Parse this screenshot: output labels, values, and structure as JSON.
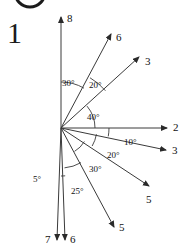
{
  "figure": {
    "number": "1",
    "origin": {
      "x": 61,
      "y": 128
    },
    "background_color": "#ffffff",
    "line_color": "#3a3a3a",
    "text_color": "#111111"
  },
  "top_partial_circle": {
    "name": "partial-circle-crop",
    "cx": 30,
    "cy": -8,
    "r": 15
  },
  "rays": [
    {
      "label": "8",
      "direction": "up",
      "angle_deg_from_up": 0,
      "tip": {
        "x": 61,
        "y": 17
      },
      "label_pos": {
        "x": 67,
        "y": 13
      }
    },
    {
      "label": "6",
      "direction": "up-right",
      "angle_deg_from_up": 30,
      "tip": {
        "x": 111,
        "y": 34
      },
      "label_pos": {
        "x": 116,
        "y": 32
      }
    },
    {
      "label": "3",
      "direction": "up-right",
      "angle_deg_from_up": 50,
      "tip": {
        "x": 139,
        "y": 57
      },
      "label_pos": {
        "x": 145,
        "y": 56
      }
    },
    {
      "label": "2",
      "direction": "right",
      "angle_deg_from_up": 90,
      "tip": {
        "x": 167,
        "y": 128
      },
      "label_pos": {
        "x": 173,
        "y": 122
      }
    },
    {
      "label": "3",
      "direction": "down-right",
      "angle_deg_from_up": 100,
      "tip": {
        "x": 166,
        "y": 150
      },
      "label_pos": {
        "x": 172,
        "y": 145
      }
    },
    {
      "label": "5",
      "direction": "down-right",
      "angle_deg_from_up": 120,
      "tip": {
        "x": 149,
        "y": 186
      },
      "label_pos": {
        "x": 146,
        "y": 194
      }
    },
    {
      "label": "5",
      "direction": "down-right-steep",
      "angle_deg_from_up": 150,
      "tip": {
        "x": 114,
        "y": 227
      },
      "label_pos": {
        "x": 119,
        "y": 222
      }
    },
    {
      "label": "6",
      "direction": "down",
      "angle_deg_from_up": 175,
      "tip": {
        "x": 65,
        "y": 240
      },
      "label_pos": {
        "x": 70,
        "y": 234
      }
    },
    {
      "label": "7",
      "direction": "down",
      "angle_deg_from_up": 180,
      "tip": {
        "x": 57,
        "y": 240
      },
      "label_pos": {
        "x": 45,
        "y": 234
      }
    }
  ],
  "angle_labels": [
    {
      "text": "30°",
      "x": 62,
      "y": 78
    },
    {
      "text": "20°",
      "x": 89,
      "y": 80
    },
    {
      "text": "40°",
      "x": 87,
      "y": 112
    },
    {
      "text": "10°",
      "x": 124,
      "y": 137
    },
    {
      "text": "20°",
      "x": 107,
      "y": 150
    },
    {
      "text": "30°",
      "x": 89,
      "y": 164
    },
    {
      "text": "25°",
      "x": 71,
      "y": 186
    },
    {
      "text": "5°",
      "x": 33,
      "y": 174
    }
  ],
  "angle_arcs": [
    {
      "name": "arc-30-up-to-6",
      "radius": 46,
      "start_deg_from_up": 0,
      "end_deg_from_up": 30
    },
    {
      "name": "arc-20-6-to-3",
      "radius": 58,
      "start_deg_from_up": 30,
      "end_deg_from_up": 50
    },
    {
      "name": "arc-40-3-to-2",
      "radius": 34,
      "start_deg_from_up": 50,
      "end_deg_from_up": 90
    },
    {
      "name": "arc-10-2-to-3",
      "radius": 48,
      "start_deg_from_up": 90,
      "end_deg_from_up": 100
    },
    {
      "name": "arc-20-3-to-5",
      "radius": 36,
      "start_deg_from_up": 100,
      "end_deg_from_up": 120
    },
    {
      "name": "arc-30-5-to-5",
      "radius": 27,
      "start_deg_from_up": 120,
      "end_deg_from_up": 150
    },
    {
      "name": "arc-25-5-to-6",
      "radius": 40,
      "start_deg_from_up": 150,
      "end_deg_from_up": 175
    },
    {
      "name": "arc-5-6-to-7",
      "radius": 48,
      "start_deg_from_up": 175,
      "end_deg_from_up": 180
    }
  ]
}
